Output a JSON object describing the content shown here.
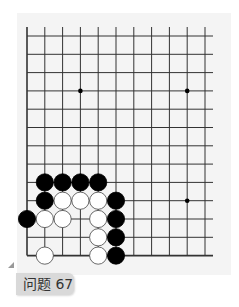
{
  "problem": {
    "label": "问题 67"
  },
  "board": {
    "columns": 11,
    "rows": 13,
    "origin_x": 27,
    "origin_y": 36,
    "spacing_x": 17.8,
    "spacing_y": 18.3,
    "vertical_line_top": 27,
    "right_edge_open": true,
    "left_edge": true,
    "bottom_edge": true,
    "star_points": [
      [
        3,
        3
      ],
      [
        9,
        3
      ],
      [
        9,
        9
      ]
    ],
    "stones": [
      {
        "color": "black",
        "col": 1,
        "row": 8
      },
      {
        "color": "black",
        "col": 2,
        "row": 8
      },
      {
        "color": "black",
        "col": 3,
        "row": 8
      },
      {
        "color": "black",
        "col": 4,
        "row": 8
      },
      {
        "color": "black",
        "col": 1,
        "row": 9
      },
      {
        "color": "white",
        "col": 2,
        "row": 9
      },
      {
        "color": "white",
        "col": 3,
        "row": 9
      },
      {
        "color": "white",
        "col": 4,
        "row": 9
      },
      {
        "color": "black",
        "col": 5,
        "row": 9
      },
      {
        "color": "black",
        "col": 0,
        "row": 10
      },
      {
        "color": "white",
        "col": 1,
        "row": 10
      },
      {
        "color": "white",
        "col": 2,
        "row": 10
      },
      {
        "color": "white",
        "col": 4,
        "row": 10
      },
      {
        "color": "black",
        "col": 5,
        "row": 10
      },
      {
        "color": "white",
        "col": 4,
        "row": 11
      },
      {
        "color": "black",
        "col": 5,
        "row": 11
      },
      {
        "color": "white",
        "col": 1,
        "row": 12
      },
      {
        "color": "white",
        "col": 4,
        "row": 12
      },
      {
        "color": "black",
        "col": 5,
        "row": 12
      }
    ],
    "colors": {
      "line": "#333333",
      "black_stone": "#000000",
      "white_stone": "#ffffff",
      "background": "#f4f4f4"
    }
  }
}
